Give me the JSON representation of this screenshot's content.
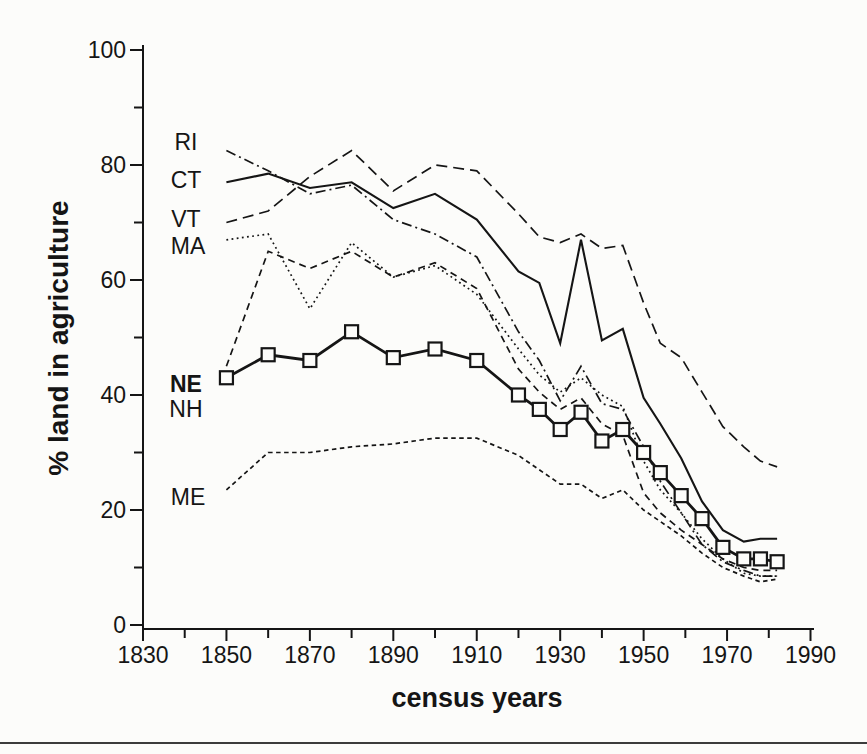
{
  "figure": {
    "background": "#fcfcfa",
    "ink_color": "#151515",
    "bottom_rule_color": "#3c3c3c"
  },
  "chart_data": {
    "type": "line",
    "title": "",
    "xlabel": "census years",
    "ylabel": "% land in agriculture",
    "xlim": [
      1830,
      1990
    ],
    "ylim": [
      0,
      100
    ],
    "grid": false,
    "legend_position": "inline-left-labels",
    "x_major_ticks": [
      1830,
      1850,
      1870,
      1890,
      1910,
      1930,
      1950,
      1970,
      1990
    ],
    "x_minor_ticks": [
      1840,
      1860,
      1880,
      1900,
      1920,
      1940,
      1960,
      1980
    ],
    "y_major_ticks": [
      0,
      20,
      40,
      60,
      80,
      100
    ],
    "y_minor_ticks": [
      10,
      30,
      50,
      70,
      90
    ],
    "x": [
      1850,
      1860,
      1870,
      1880,
      1890,
      1900,
      1910,
      1920,
      1925,
      1930,
      1935,
      1940,
      1945,
      1950,
      1954,
      1959,
      1964,
      1969,
      1974,
      1978,
      1982
    ],
    "series": [
      {
        "name": "ME",
        "style": "short-dash",
        "values": [
          23.5,
          30,
          30,
          31,
          31.5,
          32.5,
          32.5,
          29.5,
          27,
          24.5,
          24.5,
          22,
          23.5,
          20,
          18,
          15.5,
          12.5,
          10,
          8.5,
          7.5,
          8
        ]
      },
      {
        "name": "NH",
        "style": "medium-dash",
        "values": [
          45,
          65,
          62,
          65,
          60.5,
          63,
          58.5,
          44.5,
          40.5,
          37.5,
          39.5,
          35,
          33,
          23,
          19.5,
          16.5,
          14,
          11.5,
          10,
          9.5,
          9.5
        ]
      },
      {
        "name": "MA",
        "style": "dotted",
        "values": [
          67,
          68,
          55,
          66.5,
          60.5,
          62.5,
          57.5,
          48,
          43.5,
          40.5,
          43,
          40,
          38,
          28.5,
          23.5,
          19.5,
          15,
          11.5,
          9,
          8.5,
          8.5
        ]
      },
      {
        "name": "VT",
        "style": "long-dash",
        "values": [
          70,
          72,
          78,
          82.5,
          75.5,
          80,
          79,
          71.5,
          67.5,
          66.5,
          68,
          65.5,
          66,
          56,
          49,
          46.5,
          40.5,
          34.5,
          31,
          28.5,
          27.5
        ]
      },
      {
        "name": "RI",
        "style": "dash-dot",
        "values": [
          82.5,
          79,
          75,
          76.5,
          70.5,
          68,
          64,
          51,
          46,
          39,
          45,
          38.5,
          37.5,
          31,
          25,
          19.5,
          14,
          11,
          9.5,
          8.5,
          8.5
        ]
      },
      {
        "name": "CT",
        "style": "solid",
        "values": [
          77,
          78.5,
          76,
          77,
          72.5,
          75,
          70.5,
          61.5,
          59.5,
          49,
          67,
          49.5,
          51.5,
          39.5,
          35,
          29,
          21.5,
          16.5,
          14.5,
          15,
          15
        ]
      },
      {
        "name": "NE",
        "style": "solid-bold",
        "marker": "open-square",
        "values": [
          43,
          47,
          46,
          51,
          46.5,
          48,
          46,
          40,
          37.5,
          34,
          37,
          32,
          34,
          30,
          26.5,
          22.5,
          18.5,
          13.5,
          11.5,
          11.5,
          11
        ]
      }
    ],
    "series_labels": [
      {
        "text": "RI",
        "x": 1840.3,
        "y": 84.0,
        "bold": false
      },
      {
        "text": "CT",
        "x": 1840.3,
        "y": 77.4,
        "bold": false
      },
      {
        "text": "VT",
        "x": 1840.3,
        "y": 70.6,
        "bold": false
      },
      {
        "text": "MA",
        "x": 1840.8,
        "y": 65.9,
        "bold": false
      },
      {
        "text": "NE",
        "x": 1840.3,
        "y": 41.9,
        "bold": true
      },
      {
        "text": "NH",
        "x": 1840.3,
        "y": 37.6,
        "bold": false
      },
      {
        "text": "ME",
        "x": 1840.8,
        "y": 22.3,
        "bold": false
      }
    ]
  }
}
